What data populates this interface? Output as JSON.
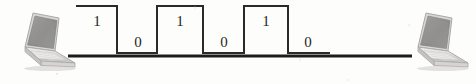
{
  "figure": {
    "background_color": "#fdfdfc",
    "line_color": "#2b2a29",
    "cable_color": "#1d1c1b"
  },
  "nodes": [
    {
      "name": "left-laptop",
      "label": "Sending computer",
      "x": 14,
      "y": 12,
      "width": 66,
      "height": 58,
      "screen_color": "#8f8e8c",
      "body_color": "#e3e2e0"
    },
    {
      "name": "right-laptop",
      "label": "Receiving computer",
      "x": 404,
      "y": 12,
      "width": 64,
      "height": 58,
      "screen_color": "#8f8e8c",
      "body_color": "#e3e2e0"
    }
  ],
  "cable": {
    "name": "network-cable",
    "x_start": 68,
    "x_end": 412,
    "y": 56,
    "thickness": 3
  },
  "signal": {
    "type": "square-wave",
    "name": "digital-signal-waveform",
    "bits": [
      "1",
      "0",
      "1",
      "0",
      "1",
      "0"
    ],
    "high_y": 6,
    "low_y": 53,
    "x_start": 76,
    "x_end": 330,
    "stroke_width": 2,
    "segments": [
      {
        "bit": "1",
        "level": "high",
        "x_start": 76,
        "x_end": 117,
        "label_x": 90,
        "label_y": 14
      },
      {
        "bit": "0",
        "level": "low",
        "x_start": 117,
        "x_end": 157,
        "label_x": 131,
        "label_y": 35
      },
      {
        "bit": "1",
        "level": "high",
        "x_start": 157,
        "x_end": 203,
        "label_x": 173,
        "label_y": 14
      },
      {
        "bit": "0",
        "level": "low",
        "x_start": 203,
        "x_end": 244,
        "label_x": 217,
        "label_y": 35
      },
      {
        "bit": "1",
        "level": "high",
        "x_start": 244,
        "x_end": 288,
        "label_x": 259,
        "label_y": 14
      },
      {
        "bit": "0",
        "level": "low",
        "x_start": 288,
        "x_end": 330,
        "label_x": 301,
        "label_y": 35
      }
    ]
  }
}
